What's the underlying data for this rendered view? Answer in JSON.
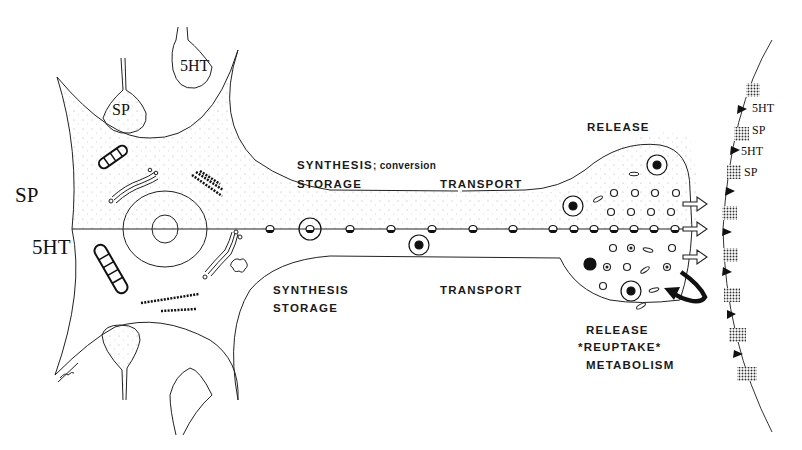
{
  "diagram": {
    "type": "neuron co-transmission schematic",
    "neurotransmitters": [
      "SP",
      "5HT"
    ],
    "colors": {
      "line": "#222222",
      "stipple": "#9a9a9a",
      "background": "#ffffff"
    }
  },
  "soma": {
    "label_upper": "SP",
    "label_lower": "5HT",
    "input_terminals": [
      {
        "label": "SP"
      },
      {
        "label": "5HT"
      }
    ],
    "signature": "Tian Tang"
  },
  "axon": {
    "upper": {
      "line1_main": "SYNTHESIS",
      "line1_suffix": "; conversion",
      "line2": "STORAGE",
      "transport": "TRANSPORT"
    },
    "lower": {
      "line1": "SYNTHESIS",
      "line2": "STORAGE",
      "transport": "TRANSPORT"
    }
  },
  "terminal": {
    "upper_label": "RELEASE",
    "lower_labels": [
      "RELEASE",
      "*REUPTAKE*",
      "METABOLISM"
    ]
  },
  "target_membrane": {
    "receptor_labels": [
      "5HT",
      "SP",
      "5HT",
      "SP"
    ]
  }
}
